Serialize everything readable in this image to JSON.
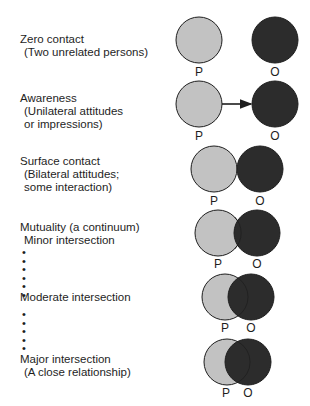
{
  "stages": [
    {
      "title": "Zero contact",
      "subtitle": "(Two unrelated persons)"
    },
    {
      "title": "Awareness",
      "subtitle": "(Unilateral attitudes",
      "subtitle2": "or impressions)"
    },
    {
      "title": "Surface contact",
      "subtitle": "(Bilateral attitudes;",
      "subtitle2": "some interaction)"
    },
    {
      "title": "Mutuality (a continuum)",
      "subtitle": "Minor intersection"
    },
    {
      "title": "Moderate intersection"
    },
    {
      "title": "Major intersection",
      "subtitle": "(A close relationship)"
    }
  ],
  "labels": {
    "p": "P",
    "o": "O"
  },
  "dots": "•\n•\n•\n•",
  "colors": {
    "p_fill": "#c2c2c2",
    "o_fill": "#2c2c2c",
    "stroke": "#1e1e1e"
  }
}
